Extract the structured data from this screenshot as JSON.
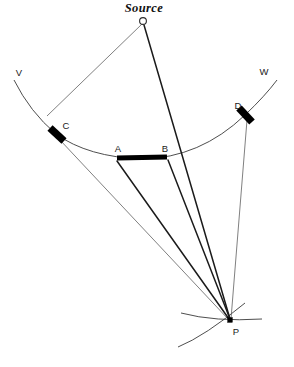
{
  "figure": {
    "title": "Source",
    "background_color": "#ffffff",
    "ink_color": "#1a1a1a",
    "width": 294,
    "height": 367
  },
  "labels": {
    "source": "Source",
    "v": "V",
    "w": "W",
    "a": "A",
    "b": "B",
    "c": "C",
    "d": "D",
    "p": "P"
  },
  "points": {
    "source": {
      "name": "Source",
      "x": 143,
      "y": 21
    },
    "v": {
      "name": "V",
      "x": 14,
      "y": 80
    },
    "w": {
      "name": "W",
      "x": 277,
      "y": 80
    },
    "a": {
      "name": "A",
      "x": 117,
      "y": 158
    },
    "b": {
      "name": "B",
      "x": 167,
      "y": 157
    },
    "c": {
      "name": "C",
      "x": 56,
      "y": 134
    },
    "d": {
      "name": "D",
      "x": 245,
      "y": 115
    },
    "p": {
      "name": "P",
      "x": 230,
      "y": 320
    }
  },
  "label_positions": {
    "source": {
      "x": 144,
      "y": 12,
      "anchor": "middle"
    },
    "v": {
      "x": 19,
      "y": 76,
      "anchor": "middle"
    },
    "w": {
      "x": 264,
      "y": 75,
      "anchor": "middle"
    },
    "a": {
      "x": 118,
      "y": 152,
      "anchor": "middle"
    },
    "b": {
      "x": 165,
      "y": 152,
      "anchor": "middle"
    },
    "c": {
      "x": 66,
      "y": 129,
      "anchor": "middle"
    },
    "d": {
      "x": 238,
      "y": 109,
      "anchor": "middle"
    },
    "p": {
      "x": 236,
      "y": 335,
      "anchor": "middle"
    }
  },
  "geometry": {
    "main_wavefront_arc": "M 14,80 Q 30,112 56,134 Q 88,157 142,159 Q 200,158 245,115 Q 265,96 277,80",
    "ray_source_to_c": "M 142,24 L 47,116",
    "ray_source_to_p": "M 144,25 L 230,319",
    "ray_c_to_p": "M 60,140 L 229,320",
    "ray_a_to_p": "M 117,161 L 229,319",
    "ray_b_to_p": "M 168,160 L 230,319",
    "ray_d_to_p": "M 247,120 L 231,319",
    "segment_ab": "M 117,158 L 167,157",
    "marker_c": "M 50,128 L 64,141",
    "marker_d": "M 239,108 L 252,122",
    "secondary_arc_flat": "M 181,313 Q 215,322 262,319",
    "secondary_arc_diag": "M 178,347 Q 205,336 245,303"
  },
  "elements": {
    "source_circle_radius": 3.4,
    "p_square_size": 4.6
  }
}
